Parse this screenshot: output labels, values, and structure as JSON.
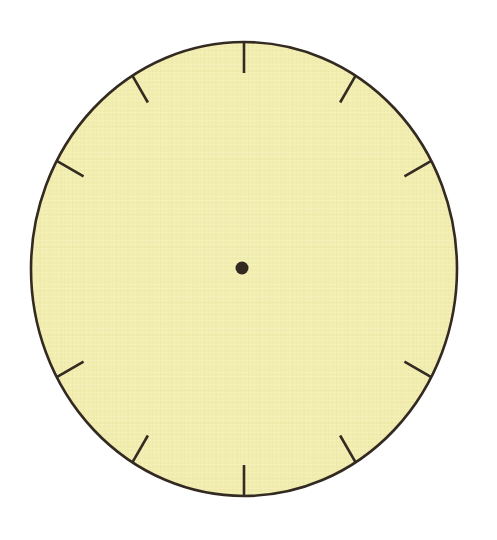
{
  "document": {
    "type": "worksheet-graphic",
    "title": "Blank Clock Face",
    "background_color": "#ffffff",
    "width": 497,
    "height": 540
  },
  "clock_face": {
    "name": "blank-analog-clock-face",
    "shape": "ellipse",
    "center": {
      "x": 244,
      "y": 269
    },
    "radius_x": 213,
    "radius_y": 227,
    "fill_color": "#f2eeb2",
    "outline_color": "#332b22",
    "outline_width": 2.6,
    "texture": "woven-paper",
    "texture_color": "#e9e4a2",
    "numerals_shown": false,
    "hands_shown": false,
    "numerals": []
  },
  "center_pin": {
    "name": "clock-center-dot",
    "x": 242,
    "y": 268,
    "radius": 6.5,
    "color": "#322a20"
  },
  "hour_ticks": {
    "count": 10,
    "missing_positions": [
      3,
      9
    ],
    "length": 31,
    "thickness": 2.6,
    "color": "#332b22",
    "marks": [
      {
        "hour": 12,
        "angle_deg": 0,
        "present": true
      },
      {
        "hour": 1,
        "angle_deg": 30,
        "present": true
      },
      {
        "hour": 2,
        "angle_deg": 60,
        "present": true
      },
      {
        "hour": 3,
        "angle_deg": 90,
        "present": false
      },
      {
        "hour": 4,
        "angle_deg": 120,
        "present": true
      },
      {
        "hour": 5,
        "angle_deg": 150,
        "present": true
      },
      {
        "hour": 6,
        "angle_deg": 180,
        "present": true
      },
      {
        "hour": 7,
        "angle_deg": 210,
        "present": true
      },
      {
        "hour": 8,
        "angle_deg": 240,
        "present": true
      },
      {
        "hour": 9,
        "angle_deg": 270,
        "present": false
      },
      {
        "hour": 10,
        "angle_deg": 300,
        "present": true
      },
      {
        "hour": 11,
        "angle_deg": 330,
        "present": true
      }
    ]
  }
}
